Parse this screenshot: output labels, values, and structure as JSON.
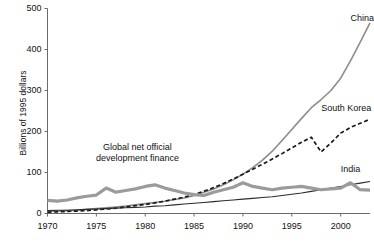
{
  "chart_data": {
    "type": "line",
    "title": "",
    "xlabel": "",
    "ylabel": "Billions of 1995 dollars",
    "xlim": [
      1970,
      2003
    ],
    "ylim": [
      0,
      500
    ],
    "grid": false,
    "legend_position": "inline-labels",
    "xticks": [
      "1970",
      "1975",
      "1980",
      "1985",
      "1990",
      "1995",
      "2000"
    ],
    "xtick_values": [
      1970,
      1975,
      1980,
      1985,
      1990,
      1995,
      2000
    ],
    "yticks": [
      "0",
      "100",
      "200",
      "300",
      "400",
      "500"
    ],
    "ytick_values": [
      0,
      100,
      200,
      300,
      400,
      500
    ],
    "x": [
      1970,
      1971,
      1972,
      1973,
      1974,
      1975,
      1976,
      1977,
      1978,
      1979,
      1980,
      1981,
      1982,
      1983,
      1984,
      1985,
      1986,
      1987,
      1988,
      1989,
      1990,
      1991,
      1992,
      1993,
      1994,
      1995,
      1996,
      1997,
      1998,
      1999,
      2000,
      2001,
      2002,
      2003
    ],
    "series": [
      {
        "name": "China",
        "color": "#8c8c8c",
        "style": "solid",
        "width": 1.6,
        "label_anchor": {
          "x": 2001,
          "y": 478
        },
        "values": [
          5,
          6,
          7,
          8,
          10,
          12,
          14,
          16,
          18,
          21,
          24,
          27,
          30,
          34,
          38,
          44,
          52,
          60,
          70,
          82,
          96,
          112,
          130,
          152,
          178,
          205,
          232,
          258,
          278,
          300,
          330,
          372,
          418,
          465
        ]
      },
      {
        "name": "South Korea",
        "color": "#1a1a1a",
        "style": "dashed",
        "width": 1.7,
        "label_anchor": {
          "x": 1998,
          "y": 258
        },
        "values": [
          3,
          4,
          5,
          6,
          7,
          9,
          11,
          13,
          16,
          19,
          22,
          26,
          30,
          35,
          40,
          46,
          54,
          63,
          73,
          84,
          96,
          108,
          120,
          133,
          146,
          160,
          174,
          186,
          150,
          172,
          196,
          210,
          220,
          230
        ]
      },
      {
        "name": "India",
        "color": "#2b2b2b",
        "style": "solid",
        "width": 1.1,
        "label_anchor": {
          "x": 2000,
          "y": 108
        },
        "values": [
          7,
          8,
          8,
          9,
          10,
          11,
          12,
          13,
          14,
          15,
          16,
          18,
          19,
          21,
          23,
          25,
          27,
          29,
          31,
          33,
          35,
          37,
          39,
          41,
          44,
          47,
          50,
          54,
          58,
          62,
          66,
          70,
          74,
          78
        ]
      },
      {
        "name": "Global net official development finance",
        "color": "#9b9b9b",
        "style": "solid",
        "width": 3.2,
        "label_anchor": {
          "x": 1979.2,
          "y": 160
        },
        "values": [
          32,
          30,
          33,
          38,
          42,
          45,
          62,
          52,
          56,
          60,
          66,
          70,
          62,
          56,
          50,
          46,
          44,
          52,
          58,
          64,
          75,
          66,
          62,
          58,
          62,
          64,
          66,
          62,
          58,
          60,
          62,
          75,
          58,
          57
        ]
      }
    ]
  }
}
